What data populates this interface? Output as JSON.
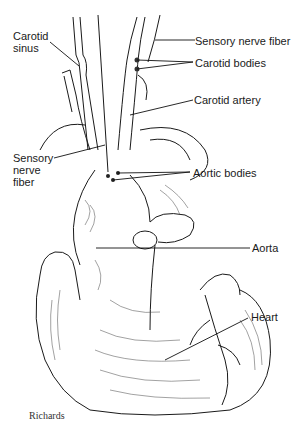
{
  "diagram": {
    "labels": {
      "carotid_sinus": "Carotid sinus",
      "carotid_sinus_line1": "Carotid",
      "carotid_sinus_line2": "sinus",
      "sensory_nerve_fiber_top": "Sensory nerve fiber",
      "carotid_bodies": "Carotid bodies",
      "carotid_artery": "Carotid artery",
      "sensory_nerve_fiber_left_line1": "Sensory",
      "sensory_nerve_fiber_left_line2": "nerve",
      "sensory_nerve_fiber_left_line3": "fiber",
      "aortic_bodies": "Aortic bodies",
      "aorta": "Aorta",
      "heart": "Heart"
    },
    "signature": "Richards"
  }
}
